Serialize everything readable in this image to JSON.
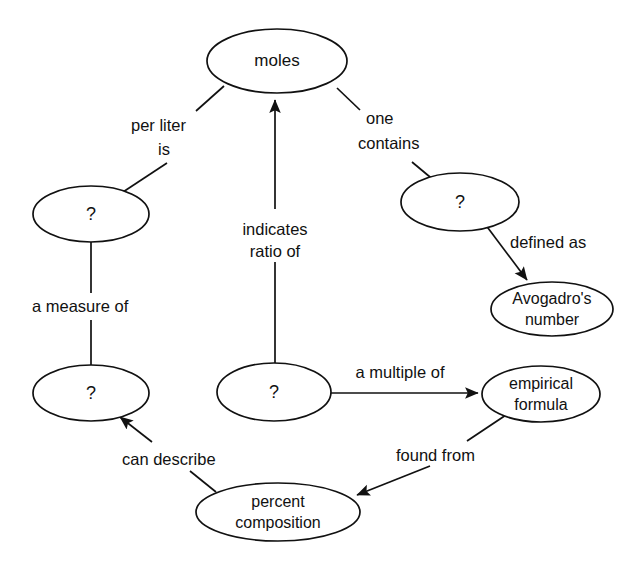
{
  "diagram": {
    "type": "concept-map",
    "background_color": "#ffffff",
    "line_color": "#111111",
    "text_color": "#111111",
    "nodes": [
      {
        "id": "moles",
        "label": "moles",
        "lines": [
          "moles"
        ],
        "cx": 277,
        "cy": 61,
        "rx": 70,
        "ry": 32
      },
      {
        "id": "left-q",
        "label": "?",
        "lines": [
          "?"
        ],
        "cx": 91,
        "cy": 214,
        "rx": 58,
        "ry": 28
      },
      {
        "id": "right-q",
        "label": "?",
        "lines": [
          "?"
        ],
        "cx": 460,
        "cy": 202,
        "rx": 59,
        "ry": 29
      },
      {
        "id": "avogadro",
        "label": "Avogadro's number",
        "lines": [
          "Avogadro's",
          "number"
        ],
        "cx": 552,
        "cy": 309,
        "rx": 61,
        "ry": 27
      },
      {
        "id": "lower-left-q",
        "label": "?",
        "lines": [
          "?"
        ],
        "cx": 91,
        "cy": 393,
        "rx": 58,
        "ry": 28
      },
      {
        "id": "center-q",
        "label": "?",
        "lines": [
          "?"
        ],
        "cx": 274,
        "cy": 392,
        "rx": 57,
        "ry": 29
      },
      {
        "id": "empirical",
        "label": "empirical formula",
        "lines": [
          "empirical",
          "formula"
        ],
        "cx": 541,
        "cy": 394,
        "rx": 59,
        "ry": 28
      },
      {
        "id": "percent",
        "label": "percent composition",
        "lines": [
          "percent",
          "composition"
        ],
        "cx": 278,
        "cy": 512,
        "rx": 82,
        "ry": 29
      }
    ],
    "edges": [
      {
        "id": "moles-to-left-q",
        "from": "moles",
        "to": "left-q",
        "label": "per liter is",
        "label_lines": [
          "per liter",
          "is"
        ],
        "arrow": "none"
      },
      {
        "id": "center-q-to-moles",
        "from": "center-q",
        "to": "moles",
        "label": "indicates ratio of",
        "label_lines": [
          "indicates",
          "ratio of"
        ],
        "arrow": "to-moles"
      },
      {
        "id": "moles-to-right-q",
        "from": "moles",
        "to": "right-q",
        "label": "one contains",
        "label_lines": [
          "one",
          "contains"
        ],
        "arrow": "none"
      },
      {
        "id": "right-q-to-avogadro",
        "from": "right-q",
        "to": "avogadro",
        "label": "defined as",
        "label_lines": [
          "defined as"
        ],
        "arrow": "to-avogadro"
      },
      {
        "id": "left-q-to-lower-left-q",
        "from": "left-q",
        "to": "lower-left-q",
        "label": "a measure of",
        "label_lines": [
          "a measure of"
        ],
        "arrow": "none"
      },
      {
        "id": "center-q-to-empirical",
        "from": "center-q",
        "to": "empirical",
        "label": "a multiple of",
        "label_lines": [
          "a multiple of"
        ],
        "arrow": "to-empirical"
      },
      {
        "id": "empirical-to-percent",
        "from": "empirical",
        "to": "percent",
        "label": "found from",
        "label_lines": [
          "found from"
        ],
        "arrow": "to-percent"
      },
      {
        "id": "percent-to-lower-left-q",
        "from": "percent",
        "to": "lower-left-q",
        "label": "can describe",
        "label_lines": [
          "can describe"
        ],
        "arrow": "to-lower-left-q"
      }
    ],
    "edge_label_text": {
      "per_liter": "per liter",
      "is": "is",
      "one": "one",
      "contains": "contains",
      "indicates": "indicates",
      "ratio_of": "ratio of",
      "defined_as": "defined as",
      "a_measure_of": "a measure of",
      "a_multiple_of": "a multiple of",
      "found_from": "found from",
      "can_describe": "can describe"
    },
    "node_label_text": {
      "moles": "moles",
      "question_left": "?",
      "question_right": "?",
      "question_lower_left": "?",
      "question_center": "?",
      "avogadro_line1": "Avogadro's",
      "avogadro_line2": "number",
      "empirical_line1": "empirical",
      "empirical_line2": "formula",
      "percent_line1": "percent",
      "percent_line2": "composition"
    }
  }
}
